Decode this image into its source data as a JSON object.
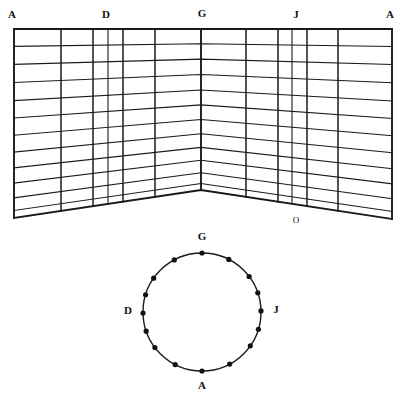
{
  "figure": {
    "background_color": "#ffffff",
    "ink_color": "#1a1a1a",
    "width": 402,
    "height": 399
  },
  "perspective_grid": {
    "name": "two-panel-perspective-grid",
    "top_edge_y": 29,
    "left_bottom_corner": {
      "x": 15,
      "y": 218
    },
    "right_bottom_corner": {
      "x": 392,
      "y": 219
    },
    "center_vertex": {
      "x": 201,
      "y": 190
    },
    "left_edge_x": 14,
    "right_edge_x": 392,
    "horizontal_row_count": 12,
    "vertical_line_x_positions": [
      14,
      61,
      93,
      108,
      123,
      155,
      201,
      246,
      278,
      292,
      307,
      338,
      392
    ],
    "vertical_line_weights": [
      "thick",
      "med",
      "med",
      "thin",
      "med",
      "med",
      "thick",
      "med",
      "med",
      "thin",
      "med",
      "med",
      "thick"
    ],
    "row_fractions": [
      0.0,
      0.092,
      0.187,
      0.283,
      0.379,
      0.471,
      0.562,
      0.651,
      0.735,
      0.815,
      0.893,
      0.96,
      1.0
    ],
    "labels": [
      {
        "text": "A",
        "x": 12,
        "y": 15,
        "size": "lg"
      },
      {
        "text": "D",
        "x": 106,
        "y": 15,
        "size": "lg"
      },
      {
        "text": "G",
        "x": 202,
        "y": 14,
        "size": "lg"
      },
      {
        "text": "J",
        "x": 296,
        "y": 15,
        "size": "lg"
      },
      {
        "text": "A",
        "x": 390,
        "y": 15,
        "size": "lg"
      },
      {
        "text": "O",
        "x": 296,
        "y": 221,
        "size": "sm"
      }
    ]
  },
  "circle_diagram": {
    "name": "divided-circle",
    "center": {
      "x": 202,
      "y": 312
    },
    "radius": 59,
    "dot_radius": 2.6,
    "dot_angles_deg": [
      270,
      297,
      323,
      341,
      359,
      17,
      35,
      62,
      90,
      117,
      143,
      161,
      179,
      197,
      215,
      242
    ],
    "labels": [
      {
        "text": "G",
        "x": 202,
        "y": 237,
        "size": "lg"
      },
      {
        "text": "D",
        "x": 128,
        "y": 311,
        "size": "lg"
      },
      {
        "text": "J",
        "x": 276,
        "y": 310,
        "size": "lg"
      },
      {
        "text": "A",
        "x": 202,
        "y": 386,
        "size": "lg"
      }
    ]
  }
}
